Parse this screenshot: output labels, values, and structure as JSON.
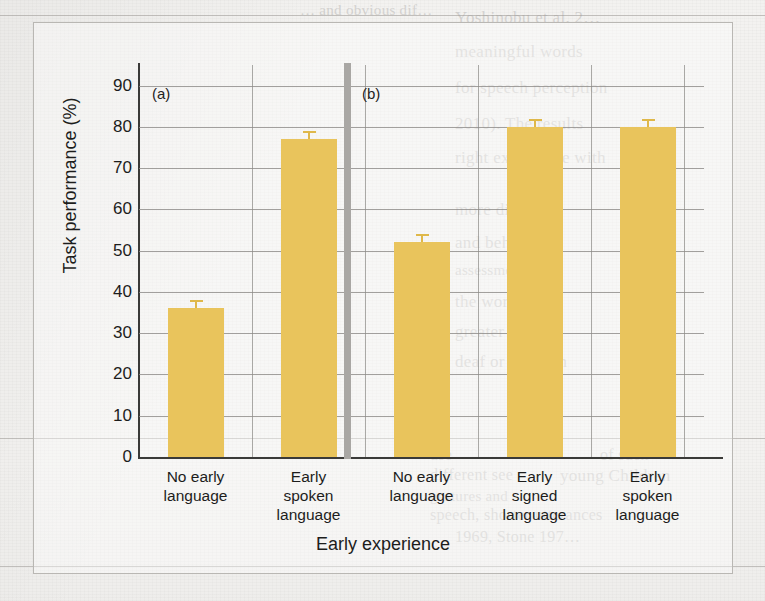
{
  "figure": {
    "panel_labels": [
      "(a)",
      "(b)"
    ],
    "separator_color": "#a9a7a4",
    "bar_color": "#e9c45c",
    "axis_color": "#3a3a38",
    "grid_color": "#8c8a87"
  },
  "chart_data": {
    "type": "bar",
    "title": "",
    "xlabel": "Early experience",
    "ylabel": "Task performance (%)",
    "categories": [
      "No early language",
      "Early spoken language",
      "No early language",
      "Early signed language",
      "Early spoken language"
    ],
    "category_lines": [
      [
        "No early",
        "language"
      ],
      [
        "Early",
        "spoken",
        "language"
      ],
      [
        "No early",
        "language"
      ],
      [
        "Early",
        "signed",
        "language"
      ],
      [
        "Early",
        "spoken",
        "language"
      ]
    ],
    "values": [
      36,
      77,
      52,
      80,
      80
    ],
    "errors": [
      2,
      2,
      2,
      2,
      2
    ],
    "panels": [
      "a",
      "a",
      "b",
      "b",
      "b"
    ],
    "ylim": [
      0,
      95
    ],
    "yticks": [
      0,
      10,
      20,
      30,
      40,
      50,
      60,
      70,
      80,
      90
    ],
    "ytick_labels": [
      "0",
      "10",
      "20",
      "30",
      "40",
      "50",
      "60",
      "70",
      "80",
      "90"
    ],
    "grid": true,
    "legend": "none"
  },
  "background_text": {
    "note": "faint show-through text from the reverse of the scanned book page",
    "lines": [
      {
        "text": "… and obvious dif…",
        "x": 300,
        "y": 2,
        "size": 15,
        "mirror": false
      },
      {
        "text": "Yoshinobu et al. 2…",
        "x": 455,
        "y": 8,
        "size": 17,
        "mirror": false
      },
      {
        "text": "meaningful words",
        "x": 455,
        "y": 42,
        "size": 17,
        "mirror": false
      },
      {
        "text": "for speech perception",
        "x": 455,
        "y": 78,
        "size": 17,
        "mirror": false
      },
      {
        "text": "2010). The results",
        "x": 455,
        "y": 114,
        "size": 17,
        "mirror": false
      },
      {
        "text": "right experience with",
        "x": 455,
        "y": 148,
        "size": 17,
        "mirror": false
      },
      {
        "text": "more disease",
        "x": 455,
        "y": 200,
        "size": 17,
        "mirror": false
      },
      {
        "text": "and behaviour",
        "x": 455,
        "y": 233,
        "size": 17,
        "mirror": false
      },
      {
        "text": "assessment",
        "x": 455,
        "y": 262,
        "size": 15,
        "mirror": false
      },
      {
        "text": "the worse",
        "x": 455,
        "y": 292,
        "size": 17,
        "mirror": false
      },
      {
        "text": "greater th…",
        "x": 455,
        "y": 322,
        "size": 17,
        "mirror": false
      },
      {
        "text": "deaf or children",
        "x": 455,
        "y": 352,
        "size": 17,
        "mirror": false
      },
      {
        "text": "use",
        "x": 430,
        "y": 446,
        "size": 16,
        "mirror": false
      },
      {
        "text": "of such",
        "x": 600,
        "y": 446,
        "size": 16,
        "mirror": false
      },
      {
        "text": "different see",
        "x": 430,
        "y": 466,
        "size": 16,
        "mirror": false
      },
      {
        "text": "young Children",
        "x": 560,
        "y": 466,
        "size": 17,
        "mirror": false
      },
      {
        "text": "gestures and",
        "x": 430,
        "y": 488,
        "size": 15,
        "mirror": false
      },
      {
        "text": "speech, shorter utterances",
        "x": 430,
        "y": 506,
        "size": 16,
        "mirror": false
      },
      {
        "text": "1969, Stone 197…",
        "x": 455,
        "y": 528,
        "size": 16,
        "mirror": false
      }
    ],
    "rules": [
      {
        "x": 0,
        "y": 15,
        "w": 765
      },
      {
        "x": 0,
        "y": 438,
        "w": 765
      },
      {
        "x": 0,
        "y": 566,
        "w": 765
      }
    ]
  }
}
